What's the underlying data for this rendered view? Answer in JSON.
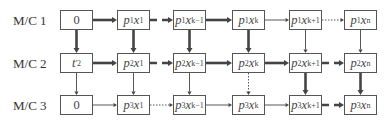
{
  "diagram": {
    "type": "machine-schedule-flow",
    "rows": [
      {
        "label": "M/C 1",
        "cells": [
          {
            "text": "0",
            "base": "0",
            "sub": "",
            "sup": "",
            "xsub": ""
          },
          {
            "base": "p",
            "sub": "1",
            "var": "x",
            "xsub": "1"
          },
          {
            "base": "p",
            "sub": "1",
            "var": "x",
            "xsub": "k−1"
          },
          {
            "base": "p",
            "sub": "1",
            "var": "x",
            "xsub": "k"
          },
          {
            "base": "p",
            "sub": "1",
            "var": "x",
            "xsub": "k+1"
          },
          {
            "base": "p",
            "sub": "1",
            "var": "x",
            "xsub": "n"
          }
        ]
      },
      {
        "label": "M/C 2",
        "cells": [
          {
            "base": "t",
            "sub": "2",
            "sup": "′",
            "var": "",
            "xsub": ""
          },
          {
            "base": "p",
            "sub": "2",
            "var": "x",
            "xsub": "1"
          },
          {
            "base": "p",
            "sub": "2",
            "var": "x",
            "xsub": "k−1"
          },
          {
            "base": "p",
            "sub": "2",
            "var": "x",
            "xsub": "k"
          },
          {
            "base": "p",
            "sub": "2",
            "var": "x",
            "xsub": "k+1"
          },
          {
            "base": "p",
            "sub": "2",
            "var": "x",
            "xsub": "n"
          }
        ]
      },
      {
        "label": "M/C 3",
        "cells": [
          {
            "text": "0",
            "base": "0",
            "sub": "",
            "sup": "",
            "xsub": ""
          },
          {
            "base": "p",
            "sub": "3",
            "var": "x",
            "xsub": "1"
          },
          {
            "base": "p",
            "sub": "3",
            "var": "x",
            "xsub": "k−1"
          },
          {
            "base": "p",
            "sub": "3",
            "var": "x",
            "xsub": "k"
          },
          {
            "base": "p",
            "sub": "3",
            "var": "x",
            "xsub": "k+1"
          },
          {
            "base": "p",
            "sub": "3",
            "var": "x",
            "xsub": "n"
          }
        ]
      }
    ],
    "horizontal_arrows": [
      [
        "thick",
        "thick-dashed",
        "thick",
        "thin",
        "dotted"
      ],
      [
        "thick",
        "thick-dashed",
        "thick",
        "thick",
        "thick-dashed"
      ],
      [
        "thin",
        "dotted",
        "thin",
        "thin",
        "thick-dashed"
      ]
    ],
    "vertical_arrows": [
      [
        "thick",
        "thick",
        "thick",
        "thick",
        "thin",
        "thin"
      ],
      [
        "thin",
        "thin",
        "thin",
        "dotted",
        "thick",
        "thick"
      ]
    ],
    "colors": {
      "line": "#444444",
      "box_border": "#555555",
      "text": "#444444"
    }
  }
}
